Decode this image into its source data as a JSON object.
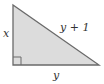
{
  "diagram": {
    "type": "right-triangle",
    "fill": "#dcdcdc",
    "stroke": "#6a6a6a",
    "labels": {
      "vertical_leg": "x",
      "hypotenuse": "y + 1",
      "horizontal_leg": "y"
    },
    "right_angle_marker": true
  }
}
